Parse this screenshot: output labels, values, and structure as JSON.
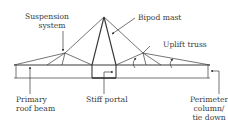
{
  "diagram": {
    "labels": {
      "suspension_line1": "Suspension",
      "suspension_line2": "system",
      "bipod_mast": "Bipod mast",
      "uplift_truss": "Uplift truss",
      "primary_line1": "Primary",
      "primary_line2": "roof beam",
      "stiff_portal": "Stiff portal",
      "perimeter_line1": "Perimeter",
      "perimeter_line2": "column/",
      "perimeter_line3": "tie down"
    },
    "colors": {
      "line": "#3a3a3a",
      "background": "#ffffff"
    }
  }
}
